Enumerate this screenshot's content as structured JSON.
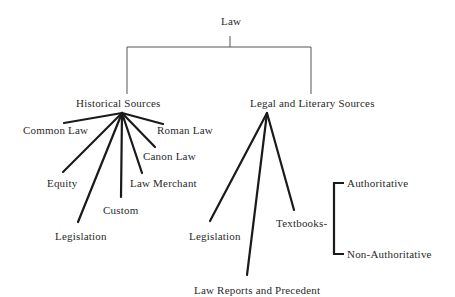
{
  "root": {
    "label": "Law"
  },
  "branches": [
    {
      "label": "Historical Sources",
      "children": [
        "Common Law",
        "Roman Law",
        "Canon Law",
        "Equity",
        "Law Merchant",
        "Custom",
        "Legislation"
      ]
    },
    {
      "label": "Legal and Literary Sources",
      "children": [
        "Legislation",
        "Law Reports and Precedent",
        "Textbooks-"
      ],
      "textbooks_subtypes": [
        "Authoritative",
        "Non-Authoritative"
      ]
    }
  ]
}
